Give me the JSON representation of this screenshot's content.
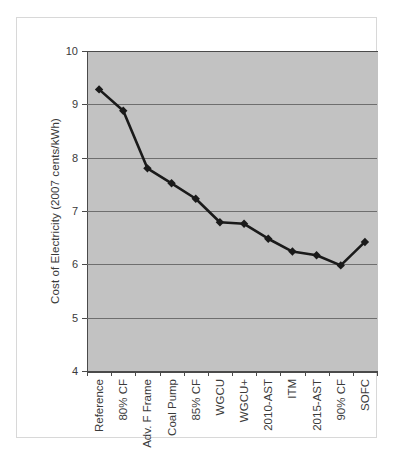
{
  "chart_data": {
    "type": "line",
    "title": "",
    "xlabel": "",
    "ylabel": "Cost of Electricity (2007 cents/kWh)",
    "categories": [
      "Reference",
      "80% CF",
      "Adv. F Frame",
      "Coal Pump",
      "85% CF",
      "WGCU",
      "WGCU+",
      "2010-AST",
      "ITM",
      "2015-AST",
      "90% CF",
      "SOFC"
    ],
    "values": [
      9.28,
      8.88,
      7.8,
      7.52,
      7.23,
      6.79,
      6.76,
      6.48,
      6.24,
      6.17,
      5.98,
      6.42
    ],
    "ylim": [
      4,
      10
    ],
    "ytick_labels": [
      "10",
      "9",
      "8",
      "7",
      "6",
      "5",
      "4"
    ],
    "ytick_values": [
      10,
      9,
      8,
      7,
      6,
      5,
      4
    ],
    "grid": true,
    "legend": false,
    "series_color": "#1a1a1a",
    "marker": "diamond",
    "plot_background": "#c2c2c2",
    "gridline_color": "#6e6e6e",
    "axis_color": "#4a4a4a"
  }
}
